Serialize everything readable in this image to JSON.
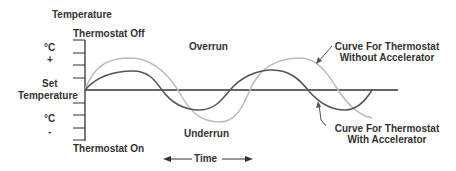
{
  "diagram": {
    "y_axis_title": "Temperature",
    "top_label": "Thermostat Off",
    "bottom_label": "Thermostat On",
    "upper_unit": "°C",
    "upper_sign": "+",
    "set_label_line1": "Set",
    "set_label_line2": "Temperature",
    "lower_unit": "°C",
    "lower_sign": "-",
    "overrun_label": "Overrun",
    "underrun_label": "Underrun",
    "time_label": "Time",
    "curve_without_line1": "Curve For Thermostat",
    "curve_without_line2": "Without Accelerator",
    "curve_with_line1": "Curve For Thermostat",
    "curve_with_line2": "With Accelerator",
    "colors": {
      "axis": "#333333",
      "curve_with_accelerator": "#555555",
      "curve_without_accelerator": "#bbbbbb",
      "text": "#333333"
    }
  }
}
